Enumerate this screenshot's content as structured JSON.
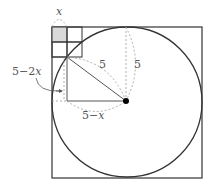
{
  "diagram": {
    "type": "geometry",
    "labels": {
      "x_top": "x",
      "left": "5−2x",
      "radius_diag": "5",
      "radius_vert": "5",
      "bottom": "5−x"
    },
    "colors": {
      "stroke": "#333333",
      "dashed": "#999999",
      "shade": "#d9d9d9",
      "text": "#555555"
    }
  }
}
